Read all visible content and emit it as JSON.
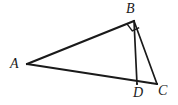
{
  "figure": {
    "background_color": "#ffffff",
    "stroke_color": "#1a1a1a",
    "label_color": "#1a1a1a",
    "width": 178,
    "height": 105,
    "points": {
      "A": {
        "x": 27,
        "y": 64
      },
      "B": {
        "x": 134,
        "y": 21
      },
      "C": {
        "x": 157,
        "y": 84
      },
      "D": {
        "x": 137,
        "y": 84
      }
    },
    "segments": [
      {
        "name": "AB",
        "from": "A",
        "to": "B",
        "stroke_width": 2.2
      },
      {
        "name": "AC",
        "from": "A",
        "to": "C",
        "stroke_width": 2.2
      },
      {
        "name": "BD",
        "from": "B",
        "to": "D",
        "stroke_width": 1.7
      },
      {
        "name": "BC",
        "from": "B",
        "to": "C",
        "stroke_width": 1.7
      }
    ],
    "right_angle": {
      "at_vertex": "B",
      "marker": "square",
      "size": 8,
      "label": "90 degrees"
    },
    "labels": {
      "A": "A",
      "B": "B",
      "C": "C",
      "D": "D"
    }
  }
}
